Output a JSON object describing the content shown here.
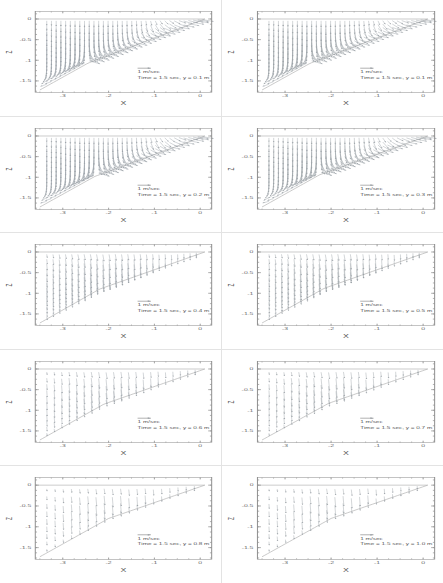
{
  "figure": {
    "title": "",
    "layout": {
      "rows": 5,
      "cols": 2,
      "panel_count": 10
    }
  },
  "chart_data": {
    "type": "scatter",
    "xlabel": "X",
    "ylabel": "Z",
    "xlim": [
      -3.6,
      0.25
    ],
    "ylim": [
      -1.78,
      0.18
    ],
    "xticks": [
      -3,
      -2,
      -1,
      0
    ],
    "xticklabels": [
      "-3",
      "-2",
      "-1",
      "0"
    ],
    "yticks": [
      0,
      -0.5,
      -1,
      -1.5
    ],
    "yticklabels": [
      "0",
      "-0.5",
      "-1",
      "-1.5"
    ],
    "grid": false,
    "legend_position": "inside-lower-right",
    "scale_label": "1 m/sec",
    "time_label": "Time = 1.5 sec",
    "panels": [
      {
        "index": 0,
        "row": 1,
        "col": 1,
        "y_section": "0.1",
        "annotation_scale": "1 m/sec",
        "annotation_time": "Time = 1.5 sec, y = 0.1 m",
        "density": "dense",
        "bed_start_x": -3.5,
        "bed_start_z": -1.72,
        "bed_end_x": 0.1,
        "bed_end_z": 0.0,
        "plateau_x": -2.45,
        "plateau_z": -1.07,
        "recirc": true
      },
      {
        "index": 1,
        "row": 1,
        "col": 2,
        "y_section": "0.1",
        "annotation_scale": "1 m/sec",
        "annotation_time": "Time = 1.5 sec, y = 0.1 m",
        "density": "dense",
        "bed_start_x": -3.5,
        "bed_start_z": -1.72,
        "bed_end_x": 0.1,
        "bed_end_z": 0.0,
        "plateau_x": -2.45,
        "plateau_z": -1.07,
        "recirc": true
      },
      {
        "index": 2,
        "row": 2,
        "col": 1,
        "y_section": "0.2",
        "annotation_scale": "1 m/sec",
        "annotation_time": "Time = 1.5 sec, y = 0.2 m",
        "density": "dense",
        "bed_start_x": -3.5,
        "bed_start_z": -1.72,
        "bed_end_x": 0.1,
        "bed_end_z": 0.0,
        "plateau_x": -2.3,
        "plateau_z": -0.98,
        "recirc": true
      },
      {
        "index": 3,
        "row": 2,
        "col": 2,
        "y_section": "0.3",
        "annotation_scale": "1 m/sec",
        "annotation_time": "Time = 1.5 sec, y = 0.3 m",
        "density": "dense",
        "bed_start_x": -3.5,
        "bed_start_z": -1.72,
        "bed_end_x": 0.1,
        "bed_end_z": 0.0,
        "plateau_x": -2.25,
        "plateau_z": -0.94,
        "recirc": true
      },
      {
        "index": 4,
        "row": 3,
        "col": 1,
        "y_section": "0.4",
        "annotation_scale": "1 m/sec",
        "annotation_time": "Time = 1.5 sec, y = 0.4 m",
        "density": "medium",
        "bed_start_x": -3.5,
        "bed_start_z": -1.72,
        "bed_end_x": 0.1,
        "bed_end_z": 0.0,
        "plateau_x": -2.2,
        "plateau_z": -0.9,
        "recirc": false
      },
      {
        "index": 5,
        "row": 3,
        "col": 2,
        "y_section": "0.5",
        "annotation_scale": "1 m/sec",
        "annotation_time": "Time = 1.5 sec, y = 0.5 m",
        "density": "medium",
        "bed_start_x": -3.5,
        "bed_start_z": -1.72,
        "bed_end_x": 0.1,
        "bed_end_z": 0.0,
        "plateau_x": -2.15,
        "plateau_z": -0.88,
        "recirc": false
      },
      {
        "index": 6,
        "row": 4,
        "col": 1,
        "y_section": "0.6",
        "annotation_scale": "1 m/sec",
        "annotation_time": "Time = 1.5 sec, y = 0.6 m",
        "density": "sparse",
        "bed_start_x": -3.5,
        "bed_start_z": -1.72,
        "bed_end_x": 0.1,
        "bed_end_z": 0.0,
        "plateau_x": -2.1,
        "plateau_z": -0.85,
        "recirc": false
      },
      {
        "index": 7,
        "row": 4,
        "col": 2,
        "y_section": "0.7",
        "annotation_scale": "1 m/sec",
        "annotation_time": "Time = 1.5 sec, y = 0.7 m",
        "density": "sparse",
        "bed_start_x": -3.5,
        "bed_start_z": -1.72,
        "bed_end_x": 0.1,
        "bed_end_z": 0.0,
        "plateau_x": -2.05,
        "plateau_z": -0.83,
        "recirc": false
      },
      {
        "index": 8,
        "row": 5,
        "col": 1,
        "y_section": "0.8",
        "annotation_scale": "1 m/sec",
        "annotation_time": "Time = 1.5 sec, y = 0.8 m",
        "density": "verysparse",
        "bed_start_x": -3.5,
        "bed_start_z": -1.72,
        "bed_end_x": 0.1,
        "bed_end_z": 0.0,
        "plateau_x": -2.0,
        "plateau_z": -0.8,
        "recirc": false
      },
      {
        "index": 9,
        "row": 5,
        "col": 2,
        "y_section": "1.0",
        "annotation_scale": "1 m/sec",
        "annotation_time": "Time = 1.5 sec, y = 1.0 m",
        "density": "verysparse",
        "bed_start_x": -3.5,
        "bed_start_z": -1.72,
        "bed_end_x": 0.1,
        "bed_end_z": 0.0,
        "plateau_x": -2.0,
        "plateau_z": -0.8,
        "recirc": false
      }
    ]
  }
}
